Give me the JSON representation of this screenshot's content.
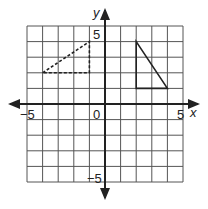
{
  "graph": {
    "x_label": "x",
    "y_label": "y",
    "x_min": -5,
    "x_max": 5,
    "y_min": -5,
    "y_max": 5,
    "ticks": {
      "x_neg": "−5",
      "x_pos": "5",
      "y_pos": "5",
      "y_neg": "−5",
      "origin": "0"
    },
    "grid_color": "#555555",
    "axis_color": "#222222"
  },
  "shapes": [
    {
      "name": "dashed-triangle",
      "style": "dashed",
      "vertices": [
        [
          -4,
          2
        ],
        [
          -1,
          4
        ],
        [
          -1,
          2
        ]
      ]
    },
    {
      "name": "solid-triangle",
      "style": "solid",
      "vertices": [
        [
          2,
          4
        ],
        [
          2,
          1
        ],
        [
          4,
          1
        ]
      ]
    }
  ]
}
